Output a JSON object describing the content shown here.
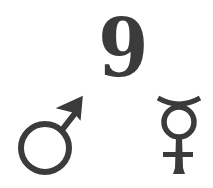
{
  "figure": {
    "number_label": "9",
    "symbols": [
      {
        "name": "mars-symbol",
        "glyph": "♂",
        "meaning": "Mars / male"
      },
      {
        "name": "mercury-symbol",
        "glyph": "☿",
        "meaning": "Mercury"
      }
    ],
    "colors": {
      "ink": "#3b3b3b",
      "background": "#ffffff"
    }
  }
}
